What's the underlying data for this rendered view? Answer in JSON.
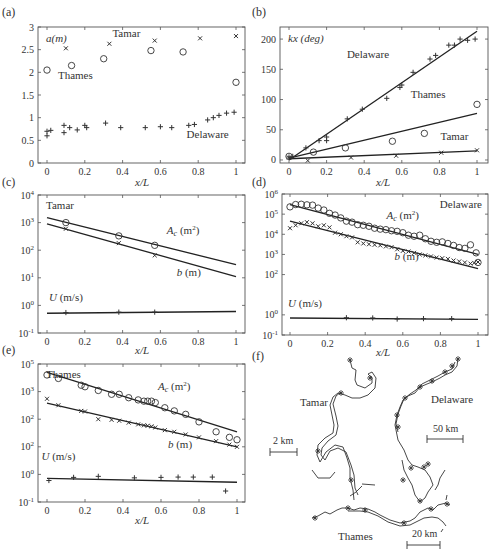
{
  "figure": {
    "panel_labels": [
      "(a)",
      "(b)",
      "(c)",
      "(d)",
      "(e)",
      "(f)"
    ],
    "xlabel": "x/L"
  },
  "chart_data": [
    {
      "id": "a",
      "type": "scatter",
      "title": "",
      "ylabel": "a(m)",
      "xlabel": "x/L",
      "xlim": [
        0,
        1
      ],
      "ylim": [
        0,
        3
      ],
      "xticks": [
        0,
        0.2,
        0.4,
        0.6,
        0.8,
        1
      ],
      "xtick_labels": [
        "0",
        "0.2",
        "0.4",
        "0.6",
        "0.8",
        "1"
      ],
      "yticks": [
        0,
        0.5,
        1,
        1.5,
        2,
        2.5,
        3
      ],
      "ytick_labels": [
        "0",
        "0.5",
        "1",
        "1.5",
        "2",
        "2.5",
        "3"
      ],
      "annotations": [
        {
          "text": "Tamar",
          "x": 0.42,
          "y": 2.78
        },
        {
          "text": "Thames",
          "x": 0.15,
          "y": 1.85
        },
        {
          "text": "Delaware",
          "x": 0.85,
          "y": 0.55
        }
      ],
      "series": [
        {
          "name": "Tamar",
          "marker": "x",
          "x": [
            0.1,
            0.33,
            0.57,
            0.81,
            1.0
          ],
          "y": [
            2.53,
            2.63,
            2.7,
            2.75,
            2.8
          ]
        },
        {
          "name": "Thames",
          "marker": "o",
          "x": [
            0.0,
            0.13,
            0.3,
            0.55,
            0.72,
            1.0
          ],
          "y": [
            2.05,
            2.15,
            2.3,
            2.48,
            2.45,
            1.78
          ]
        },
        {
          "name": "Delaware",
          "marker": "+",
          "x": [
            0.0,
            0.0,
            0.02,
            0.09,
            0.09,
            0.12,
            0.16,
            0.2,
            0.21,
            0.31,
            0.39,
            0.52,
            0.6,
            0.66,
            0.75,
            0.78,
            0.85,
            0.88,
            0.91,
            0.95,
            0.99
          ],
          "y": [
            0.6,
            0.7,
            0.72,
            0.83,
            0.67,
            0.78,
            0.73,
            0.83,
            0.78,
            0.88,
            0.78,
            0.78,
            0.8,
            0.78,
            0.83,
            0.85,
            0.95,
            1.0,
            1.05,
            1.1,
            1.12
          ]
        }
      ]
    },
    {
      "id": "b",
      "type": "scatter",
      "ylabel": "kx (deg)",
      "xlabel": "x/L",
      "xlim": [
        0,
        1
      ],
      "ylim": [
        -5,
        220
      ],
      "xticks": [
        0,
        0.2,
        0.4,
        0.6,
        0.8,
        1
      ],
      "xtick_labels": [
        "0",
        "0.2",
        "0.4",
        "0.6",
        "0.8",
        "1"
      ],
      "yticks": [
        0,
        50,
        100,
        150,
        200
      ],
      "ytick_labels": [
        "0",
        "50",
        "100",
        "150",
        "200"
      ],
      "annotations": [
        {
          "text": "Delaware",
          "x": 0.42,
          "y": 168
        },
        {
          "text": "Thames",
          "x": 0.74,
          "y": 103
        },
        {
          "text": "Tamar",
          "x": 0.88,
          "y": 33
        }
      ],
      "fits": [
        {
          "name": "Delaware",
          "x": [
            0,
            1
          ],
          "y": [
            0,
            213
          ]
        },
        {
          "name": "Thames",
          "x": [
            0,
            1
          ],
          "y": [
            3,
            77
          ]
        },
        {
          "name": "Tamar",
          "x": [
            0,
            1
          ],
          "y": [
            2,
            15
          ]
        }
      ],
      "series": [
        {
          "name": "Delaware",
          "marker": "+",
          "x": [
            0.0,
            0.02,
            0.09,
            0.16,
            0.2,
            0.2,
            0.31,
            0.39,
            0.52,
            0.59,
            0.6,
            0.66,
            0.75,
            0.78,
            0.85,
            0.88,
            0.91,
            0.95,
            0.99
          ],
          "y": [
            5,
            6,
            20,
            32,
            32,
            38,
            68,
            84,
            102,
            120,
            124,
            145,
            167,
            173,
            190,
            190,
            200,
            198,
            200
          ]
        },
        {
          "name": "Thames",
          "marker": "o",
          "x": [
            0.0,
            0.13,
            0.3,
            0.55,
            0.72,
            1.0
          ],
          "y": [
            6,
            13,
            20,
            31,
            44,
            92
          ]
        },
        {
          "name": "Tamar",
          "marker": "x",
          "x": [
            0.0,
            0.1,
            0.33,
            0.57,
            0.81,
            1.0
          ],
          "y": [
            4,
            -1,
            4,
            7,
            12,
            16
          ]
        }
      ]
    },
    {
      "id": "c",
      "type": "scatter",
      "scale": "log",
      "title": "Tamar",
      "xlabel": "x/L",
      "xlim": [
        0,
        1
      ],
      "ylim_exp": [
        -1,
        4
      ],
      "xticks": [
        0,
        0.2,
        0.4,
        0.6,
        0.8,
        1
      ],
      "xtick_labels": [
        "0",
        "0.2",
        "0.4",
        "0.6",
        "0.8",
        "1"
      ],
      "ytick_exps": [
        -1,
        0,
        1,
        2,
        3,
        4
      ],
      "ytick_labels": [
        "10^-1",
        "10^0",
        "10^1",
        "10^2",
        "10^3",
        "10^4"
      ],
      "annotations": [
        {
          "text": "Ac (m2)",
          "x": 0.72,
          "y": 400
        },
        {
          "text": "b (m)",
          "x": 0.75,
          "y": 12
        },
        {
          "text": "U (m/s)",
          "x": 0.1,
          "y": 1.4
        }
      ],
      "fits": [
        {
          "name": "Ac",
          "x": [
            0,
            1
          ],
          "y": [
            1500,
            30
          ]
        },
        {
          "name": "b",
          "x": [
            0,
            1
          ],
          "y": [
            900,
            11
          ]
        },
        {
          "name": "U",
          "x": [
            0,
            1
          ],
          "y": [
            0.52,
            0.6
          ]
        }
      ],
      "series": [
        {
          "name": "Ac (m2)",
          "marker": "o",
          "x": [
            0.1,
            0.38,
            0.57
          ],
          "y": [
            1000,
            330,
            150
          ]
        },
        {
          "name": "b (m)",
          "marker": "x",
          "x": [
            0.1,
            0.38,
            0.57
          ],
          "y": [
            600,
            180,
            65
          ]
        },
        {
          "name": "U (m/s)",
          "marker": "+",
          "x": [
            0.1,
            0.38,
            0.57
          ],
          "y": [
            0.55,
            0.57,
            0.57
          ]
        }
      ]
    },
    {
      "id": "d",
      "type": "scatter",
      "scale": "log",
      "title": "Delaware",
      "xlabel": "x/L",
      "xlim": [
        0,
        1
      ],
      "ylim_exp": [
        -1,
        6
      ],
      "xticks": [
        0,
        0.2,
        0.4,
        0.6,
        0.8,
        1
      ],
      "xtick_labels": [
        "0",
        "0.2",
        "0.4",
        "0.6",
        "0.8",
        "1"
      ],
      "ytick_exps": [
        -1,
        0,
        2,
        3,
        4,
        5,
        6
      ],
      "ytick_labels": [
        "10^-1",
        "10^0",
        "10^2",
        "10^3",
        "10^4",
        "10^5",
        "10^6"
      ],
      "annotations": [
        {
          "text": "Ac (m2)",
          "x": 0.6,
          "y": 60000
        },
        {
          "text": "b (m)",
          "x": 0.62,
          "y": 500
        },
        {
          "text": "U (m/s)",
          "x": 0.08,
          "y": 2.5
        }
      ],
      "fits": [
        {
          "name": "Ac",
          "x": [
            0,
            1
          ],
          "y": [
            300000,
            1000
          ]
        },
        {
          "name": "b",
          "x": [
            0,
            1
          ],
          "y": [
            45000,
            200
          ]
        },
        {
          "name": "U",
          "x": [
            0,
            1
          ],
          "y": [
            0.7,
            0.6
          ]
        }
      ],
      "series": [
        {
          "name": "Ac (m2)",
          "marker": "o",
          "x": [
            0.0,
            0.03,
            0.06,
            0.09,
            0.12,
            0.15,
            0.18,
            0.21,
            0.24,
            0.27,
            0.3,
            0.33,
            0.36,
            0.39,
            0.42,
            0.45,
            0.48,
            0.51,
            0.54,
            0.57,
            0.6,
            0.63,
            0.66,
            0.69,
            0.72,
            0.75,
            0.78,
            0.81,
            0.84,
            0.87,
            0.9,
            0.93,
            0.96,
            0.99,
            1.0
          ],
          "y": [
            230000,
            300000,
            310000,
            290000,
            280000,
            200000,
            160000,
            110000,
            90000,
            65000,
            45000,
            40000,
            30000,
            28000,
            25000,
            20000,
            18000,
            17000,
            15000,
            14000,
            12000,
            9000,
            8000,
            9000,
            6000,
            4500,
            4000,
            4200,
            3500,
            2800,
            2200,
            2000,
            3000,
            1200,
            400
          ]
        },
        {
          "name": "b (m)",
          "marker": "x",
          "x": [
            0.0,
            0.03,
            0.06,
            0.09,
            0.12,
            0.15,
            0.18,
            0.21,
            0.24,
            0.27,
            0.3,
            0.33,
            0.36,
            0.39,
            0.42,
            0.45,
            0.48,
            0.51,
            0.54,
            0.57,
            0.6,
            0.63,
            0.66,
            0.69,
            0.72,
            0.75,
            0.78,
            0.81,
            0.84,
            0.87,
            0.9,
            0.93,
            0.96,
            0.98,
            1.0
          ],
          "y": [
            20000,
            28000,
            35000,
            40000,
            35000,
            25000,
            28000,
            22000,
            12000,
            10000,
            8000,
            7000,
            4000,
            3500,
            3200,
            3000,
            2800,
            2500,
            2300,
            1800,
            1500,
            1400,
            1200,
            1000,
            900,
            800,
            700,
            650,
            600,
            500,
            450,
            400,
            350,
            380,
            420
          ]
        },
        {
          "name": "U (m/s)",
          "marker": "+",
          "x": [
            0.3,
            0.44,
            0.57,
            0.71,
            0.86
          ],
          "y": [
            0.72,
            0.7,
            0.62,
            0.65,
            0.65
          ]
        }
      ]
    },
    {
      "id": "e",
      "type": "scatter",
      "scale": "log",
      "title": "Thames",
      "xlabel": "x/L",
      "xlim": [
        0,
        1
      ],
      "ylim_exp": [
        -1,
        4
      ],
      "xticks": [
        0,
        0.2,
        0.4,
        0.6,
        0.8,
        1
      ],
      "xtick_labels": [
        "0",
        "0.2",
        "0.4",
        "0.6",
        "0.8",
        "1"
      ],
      "ytick_exps": [
        -1,
        0,
        1,
        2,
        3,
        4
      ],
      "ytick_labels": [
        "10^-1",
        "10^0",
        "10^2",
        "10^2",
        "10^3",
        "10^5"
      ],
      "annotations": [
        {
          "text": "Ac (m2)",
          "x": 0.67,
          "y": 1100
        },
        {
          "text": "b (m)",
          "x": 0.7,
          "y": 9
        },
        {
          "text": "U (m/s)",
          "x": 0.06,
          "y": 3.2
        }
      ],
      "fits": [
        {
          "name": "Ac",
          "x": [
            0,
            1
          ],
          "y": [
            5000,
            35
          ]
        },
        {
          "name": "b",
          "x": [
            0,
            1
          ],
          "y": [
            380,
            10
          ]
        },
        {
          "name": "U",
          "x": [
            0,
            1
          ],
          "y": [
            0.72,
            0.52
          ]
        }
      ],
      "series": [
        {
          "name": "Ac (m2)",
          "marker": "o",
          "x": [
            0.0,
            0.06,
            0.18,
            0.2,
            0.27,
            0.34,
            0.38,
            0.43,
            0.48,
            0.51,
            0.53,
            0.55,
            0.57,
            0.62,
            0.67,
            0.73,
            0.8,
            0.89,
            0.96,
            1.0
          ],
          "y": [
            4000,
            3000,
            1700,
            1500,
            1100,
            800,
            800,
            600,
            500,
            450,
            450,
            450,
            400,
            260,
            200,
            150,
            80,
            35,
            22,
            18
          ]
        },
        {
          "name": "b (m)",
          "marker": "x",
          "x": [
            0.0,
            0.06,
            0.18,
            0.2,
            0.27,
            0.34,
            0.38,
            0.43,
            0.48,
            0.51,
            0.53,
            0.55,
            0.57,
            0.62,
            0.67,
            0.73,
            0.8,
            0.89,
            0.96,
            1.0
          ],
          "y": [
            550,
            320,
            200,
            190,
            100,
            95,
            88,
            75,
            65,
            60,
            58,
            55,
            50,
            40,
            35,
            28,
            22,
            16,
            12,
            10
          ]
        },
        {
          "name": "U (m/s)",
          "marker": "+",
          "x": [
            0.01,
            0.14,
            0.27,
            0.46,
            0.6,
            0.69,
            0.77,
            0.87,
            0.94
          ],
          "y": [
            0.6,
            0.78,
            0.85,
            0.75,
            0.78,
            0.8,
            0.8,
            0.8,
            0.25
          ]
        }
      ]
    }
  ],
  "map_panel": {
    "id": "f",
    "labels": [
      {
        "text": "Tamar",
        "name": "tamar-label"
      },
      {
        "text": "Delaware",
        "name": "delaware-label"
      },
      {
        "text": "Thames",
        "name": "thames-label"
      }
    ],
    "scale_bars": [
      {
        "text": "2 km",
        "name": "tamar-scale"
      },
      {
        "text": "50 km",
        "name": "delaware-scale"
      },
      {
        "text": "20 km",
        "name": "thames-scale"
      }
    ]
  }
}
